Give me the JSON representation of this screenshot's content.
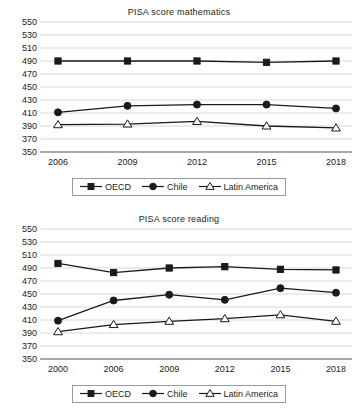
{
  "charts": [
    {
      "id": "pisa-mathematics",
      "title": "PISA score mathematics",
      "chart_data": {
        "type": "line",
        "title": "PISA score mathematics",
        "xlabel": "",
        "ylabel": "",
        "categories": [
          "2006",
          "2009",
          "2012",
          "2015",
          "2018"
        ],
        "ylim": [
          350,
          550
        ],
        "yticks": [
          350,
          370,
          390,
          410,
          430,
          450,
          470,
          490,
          510,
          530,
          550
        ],
        "grid": true,
        "legend_position": "bottom",
        "series": [
          {
            "name": "OECD",
            "marker": "square",
            "fill": "#1a1a1a",
            "values": [
              490,
              490,
              490,
              488,
              490
            ]
          },
          {
            "name": "Chile",
            "marker": "circle",
            "fill": "#1a1a1a",
            "values": [
              411,
              421,
              423,
              423,
              417
            ]
          },
          {
            "name": "Latin America",
            "marker": "triangle",
            "fill": "#ffffff",
            "values": [
              392,
              393,
              397,
              390,
              387
            ]
          }
        ]
      }
    },
    {
      "id": "pisa-reading",
      "title": "PISA score reading",
      "chart_data": {
        "type": "line",
        "title": "PISA score reading",
        "xlabel": "",
        "ylabel": "",
        "categories": [
          "2000",
          "2006",
          "2009",
          "2012",
          "2015",
          "2018"
        ],
        "ylim": [
          350,
          550
        ],
        "yticks": [
          350,
          370,
          390,
          410,
          430,
          450,
          470,
          490,
          510,
          530,
          550
        ],
        "grid": true,
        "legend_position": "bottom",
        "series": [
          {
            "name": "OECD",
            "marker": "square",
            "fill": "#1a1a1a",
            "values": [
              497,
              483,
              490,
              492,
              488,
              487
            ]
          },
          {
            "name": "Chile",
            "marker": "circle",
            "fill": "#1a1a1a",
            "values": [
              409,
              440,
              449,
              441,
              459,
              452
            ]
          },
          {
            "name": "Latin America",
            "marker": "triangle",
            "fill": "#ffffff",
            "values": [
              392,
              403,
              408,
              412,
              418,
              408
            ]
          }
        ]
      }
    }
  ],
  "colors": {
    "line": "#1a1a1a",
    "grid": "#d8d8d8",
    "axis": "#8c8c8c",
    "text": "#1d1d1d",
    "legend_border": "#9a9a9a"
  }
}
